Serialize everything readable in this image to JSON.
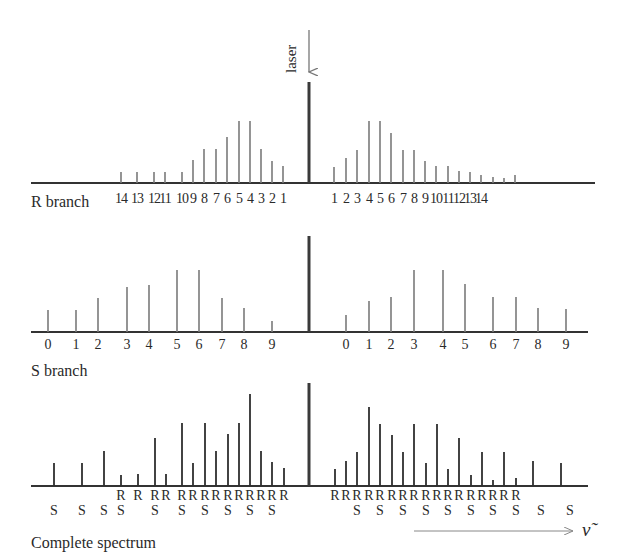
{
  "figure": {
    "laser_label": "laser",
    "nu_label": "ν̃",
    "panel_labels": {
      "r_branch": "R branch",
      "s_branch": "S branch",
      "complete": "Complete spectrum"
    }
  },
  "colors": {
    "rotational_line": "#7a7a7a",
    "complete_line": "#2e2e2e",
    "laser_line": "#3a3a3a",
    "axis": "#333333",
    "arrow": "#777777"
  },
  "chart_data": [
    {
      "type": "bar",
      "title": "R branch",
      "axis_y": 183,
      "axis_x_range": [
        31,
        595
      ],
      "laser": {
        "x": 309,
        "height": 101
      },
      "stokes_side": {
        "labels": [
          "14",
          "13",
          "12",
          "11",
          "10",
          "9",
          "8",
          "7",
          "6",
          "5",
          "4",
          "3",
          "2",
          "1"
        ],
        "x": [
          121,
          137,
          154,
          165,
          182,
          193,
          204,
          216,
          227,
          239,
          250,
          261,
          272,
          283
        ],
        "heights": [
          11,
          11,
          11,
          11,
          11,
          23,
          34,
          34,
          46,
          62,
          62,
          34,
          22,
          17
        ]
      },
      "anti_stokes_side": {
        "labels": [
          "1",
          "2",
          "3",
          "4",
          "5",
          "6",
          "7",
          "8",
          "9",
          "10",
          "11",
          "12",
          "13",
          "14"
        ],
        "x": [
          334,
          346,
          357,
          369,
          380,
          391,
          403,
          414,
          425,
          436,
          448,
          459,
          470,
          481
        ],
        "heights": [
          16,
          25,
          33,
          62,
          62,
          50,
          33,
          33,
          22,
          17,
          17,
          12,
          11,
          8
        ]
      },
      "extra_small_lines": {
        "x": [
          493,
          504,
          515
        ],
        "heights": [
          6,
          5,
          8
        ]
      }
    },
    {
      "type": "bar",
      "title": "S branch",
      "axis_y": 332,
      "axis_x_range": [
        31,
        588
      ],
      "laser": {
        "x": 309,
        "height": 96
      },
      "stokes_side": {
        "labels": [
          "0",
          "1",
          "2",
          "3",
          "4",
          "5",
          "6",
          "7",
          "8",
          "9"
        ],
        "x": [
          48,
          76,
          98,
          127,
          149,
          177,
          199,
          222,
          244,
          272
        ],
        "heights": [
          22,
          22,
          34,
          45,
          47,
          62,
          62,
          34,
          24,
          11
        ]
      },
      "anti_stokes_side": {
        "labels": [
          "0",
          "1",
          "2",
          "3",
          "4",
          "5",
          "6",
          "7",
          "8",
          "9"
        ],
        "x": [
          346,
          369,
          391,
          414,
          443,
          465,
          493,
          516,
          538,
          566
        ],
        "heights": [
          17,
          31,
          35,
          62,
          62,
          48,
          35,
          35,
          24,
          23
        ]
      }
    },
    {
      "type": "bar",
      "title": "Complete spectrum",
      "axis_y": 486,
      "axis_x_range": [
        31,
        588
      ],
      "laser": {
        "x": 309,
        "height": 103
      },
      "lines": {
        "x": [
          54,
          82,
          104,
          121,
          138,
          155,
          166,
          182,
          193,
          205,
          216,
          228,
          239,
          250,
          261,
          272,
          284,
          335,
          346,
          357,
          369,
          380,
          392,
          403,
          414,
          426,
          437,
          448,
          459,
          471,
          482,
          493,
          504,
          516,
          533,
          561
        ],
        "heights": [
          23,
          23,
          35,
          11,
          12,
          48,
          12,
          63,
          23,
          63,
          35,
          52,
          63,
          92,
          35,
          24,
          18,
          17,
          25,
          34,
          79,
          62,
          51,
          34,
          62,
          23,
          62,
          17,
          48,
          11,
          34,
          6,
          34,
          8,
          25,
          23
        ]
      },
      "r_labels": {
        "text": "R",
        "x": [
          121,
          138,
          155,
          166,
          182,
          193,
          205,
          216,
          228,
          239,
          250,
          261,
          272,
          284,
          335,
          346,
          357,
          369,
          380,
          392,
          403,
          414,
          426,
          437,
          448,
          459,
          471,
          482,
          493,
          504,
          516
        ]
      },
      "s_labels": {
        "text": "S",
        "x": [
          54,
          82,
          104,
          121,
          155,
          182,
          205,
          228,
          250,
          272,
          357,
          380,
          403,
          426,
          448,
          471,
          493,
          516,
          541,
          570
        ]
      },
      "arrow": {
        "x1": 414,
        "x2": 573,
        "y": 531
      }
    }
  ]
}
